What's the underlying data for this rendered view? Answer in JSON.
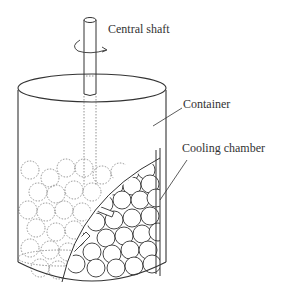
{
  "diagram": {
    "type": "apparatus-schematic",
    "labels": {
      "central_shaft": "Central shaft",
      "container": "Container",
      "cooling_chamber": "Cooling chamber"
    },
    "components": [
      {
        "id": "central-shaft",
        "description": "vertical cylindrical rod with rotation arrow"
      },
      {
        "id": "container",
        "description": "open cylindrical vessel"
      },
      {
        "id": "cooling-chamber",
        "description": "curved chamber section cut-away on right side"
      },
      {
        "id": "spheres",
        "description": "packed spherical particles, dotted behind, solid in cut-away"
      },
      {
        "id": "rods",
        "description": "two small cylindrical rods among spheres"
      }
    ],
    "colors": {
      "line": "#333333",
      "dotted": "#666666",
      "background": "#ffffff"
    }
  }
}
